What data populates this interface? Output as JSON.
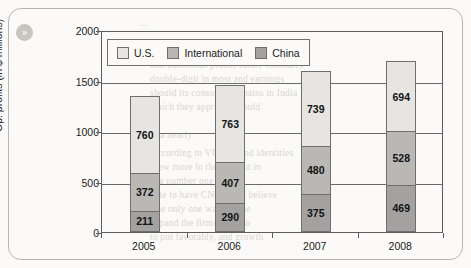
{
  "card": {
    "badge_icon": "double-chevron-right-icon",
    "badge_glyph": "»"
  },
  "background_text": [
    {
      "text": "...",
      "x": 140,
      "y": 18
    },
    {
      "text": "when VUBI needs to consider are the",
      "x": 150,
      "y": 46
    },
    {
      "text": "that additional profits future considers",
      "x": 150,
      "y": 60
    },
    {
      "text": "double-digit in most and earnings",
      "x": 150,
      "y": 74
    },
    {
      "text": "should its consumer remains in India",
      "x": 150,
      "y": 88
    },
    {
      "text": "which they approach would",
      "x": 150,
      "y": 102
    },
    {
      "text": "to a nearly",
      "x": 150,
      "y": 130
    },
    {
      "text": "According to VUBI brand identities",
      "x": 150,
      "y": 148
    },
    {
      "text": "grew more in the US, but in",
      "x": 150,
      "y": 162
    },
    {
      "text": "is a number one data",
      "x": 150,
      "y": 176
    },
    {
      "text": "date to have CNCU. We believe",
      "x": 150,
      "y": 190
    },
    {
      "text": "The only one was put the",
      "x": 150,
      "y": 204
    },
    {
      "text": "expand the firms more to",
      "x": 150,
      "y": 218
    },
    {
      "text": "to put favorably, and growth",
      "x": 150,
      "y": 232
    }
  ],
  "chart_data": {
    "type": "bar",
    "subtype": "stacked-column",
    "title": "",
    "xlabel": "",
    "ylabel": "Op. profits (in $ millions)",
    "categories": [
      "2005",
      "2006",
      "2007",
      "2008"
    ],
    "ylim": [
      0,
      2000
    ],
    "yticks": [
      0,
      500,
      1000,
      1500,
      2000
    ],
    "grid": true,
    "legend_position": "top-left-inside",
    "series": [
      {
        "name": "China",
        "color": "#a3a2a0",
        "stack_order": 0,
        "values": [
          211,
          290,
          375,
          469
        ]
      },
      {
        "name": "International",
        "color": "#b9b8b4",
        "stack_order": 1,
        "values": [
          372,
          407,
          480,
          528
        ]
      },
      {
        "name": "U.S.",
        "color": "#e6e5e2",
        "stack_order": 2,
        "values": [
          760,
          763,
          739,
          694
        ]
      }
    ],
    "totals": [
      1343,
      1460,
      1594,
      1691
    ]
  }
}
